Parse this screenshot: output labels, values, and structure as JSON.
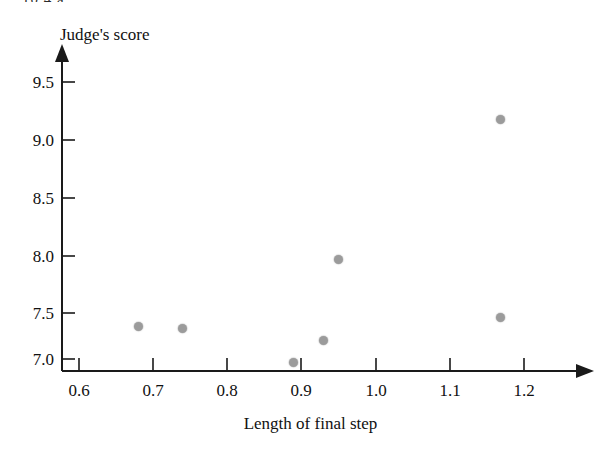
{
  "figure": {
    "problem_label": "10.4  a.",
    "background_color": "#ffffff",
    "marker_color": "#9b9b9b",
    "axis_color": "#1a1a1a"
  },
  "chart_data": {
    "type": "scatter",
    "title": "",
    "xlabel": "Length of final step",
    "ylabel": "Judge's score",
    "grid": false,
    "legend": false,
    "xlim": [
      0.56,
      1.27
    ],
    "ylim": [
      6.88,
      9.72
    ],
    "xticks": [
      0.6,
      0.7,
      0.8,
      0.9,
      1.0,
      1.1,
      1.2
    ],
    "xtick_labels": [
      "0.6",
      "0.7",
      "0.8",
      "0.9",
      "1.0",
      "1.1",
      "1.2"
    ],
    "yticks": [
      7.0,
      7.5,
      8.0,
      8.5,
      9.0,
      9.5
    ],
    "ytick_labels": [
      "7.0",
      "7.5",
      "8.0",
      "8.5",
      "9.0",
      "9.5"
    ],
    "x": [
      0.68,
      0.74,
      0.89,
      0.93,
      0.95,
      1.17,
      1.17
    ],
    "y": [
      7.38,
      7.37,
      7.07,
      7.26,
      7.96,
      9.17,
      7.46
    ],
    "points": [
      {
        "x": 0.68,
        "y": 7.38
      },
      {
        "x": 0.74,
        "y": 7.37
      },
      {
        "x": 0.89,
        "y": 7.07
      },
      {
        "x": 0.93,
        "y": 7.26
      },
      {
        "x": 0.95,
        "y": 7.96
      },
      {
        "x": 1.17,
        "y": 9.17
      },
      {
        "x": 1.17,
        "y": 7.46
      }
    ],
    "marker": "filled-circle",
    "marker_color": "#9b9b9b"
  }
}
